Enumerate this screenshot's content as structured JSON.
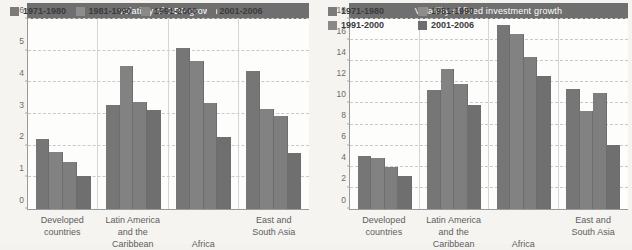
{
  "page": {
    "background_color": "#f6f4f1",
    "bar_color": "#7a7a7a",
    "title_bar_color": "#6f6f6f",
    "gridline_color": "#c9c9c9"
  },
  "charts": [
    {
      "id": "gdp-growth",
      "title": "Volatility of GDP growth",
      "type": "bar",
      "legend_rows": 1,
      "legend": [
        "1971-1980",
        "1981-1990",
        "1991-2000",
        "2001-2006"
      ],
      "categories": [
        {
          "line1": "Developed",
          "line2": "countries"
        },
        {
          "line1": "Latin America",
          "line2": "and the Caribbean"
        },
        {
          "line1": "Africa",
          "line2": ""
        },
        {
          "line1": "East and",
          "line2": "South Asia"
        }
      ],
      "yticks": [
        0,
        1,
        2,
        3,
        4,
        5,
        6
      ],
      "ylim": [
        0,
        6
      ],
      "ylabel": "",
      "xlabel": "",
      "series": [
        {
          "name": "1971-1980",
          "values": [
            2.2,
            3.28,
            5.1,
            4.35
          ]
        },
        {
          "name": "1981-1990",
          "values": [
            1.8,
            4.53,
            4.67,
            3.16
          ]
        },
        {
          "name": "1991-2000",
          "values": [
            1.5,
            3.38,
            3.35,
            2.95
          ]
        },
        {
          "name": "2001-2006",
          "values": [
            1.05,
            3.13,
            2.27,
            1.78
          ]
        }
      ]
    },
    {
      "id": "fixed-investment-growth",
      "title": "Volatility of fixed investment growth",
      "type": "bar",
      "legend_rows": 2,
      "legend": [
        "1971-1980",
        "1981-1990",
        "1991-2000",
        "2001-2006"
      ],
      "categories": [
        {
          "line1": "Developed",
          "line2": "countries"
        },
        {
          "line1": "Latin America",
          "line2": "and the Caribbean"
        },
        {
          "line1": "Africa",
          "line2": ""
        },
        {
          "line1": "East and",
          "line2": "South Asia"
        }
      ],
      "yticks": [
        0,
        2,
        4,
        6,
        8,
        10,
        12,
        14,
        16,
        18
      ],
      "ylim": [
        0,
        18
      ],
      "ylabel": "",
      "xlabel": "",
      "series": [
        {
          "name": "1971-1980",
          "values": [
            5.0,
            11.25,
            17.4,
            11.35
          ]
        },
        {
          "name": "1981-1990",
          "values": [
            4.85,
            13.3,
            16.6,
            9.3
          ]
        },
        {
          "name": "1991-2000",
          "values": [
            4.0,
            11.8,
            14.4,
            10.95
          ]
        },
        {
          "name": "2001-2006",
          "values": [
            3.15,
            9.85,
            12.6,
            6.1
          ]
        }
      ]
    }
  ],
  "chart_data": [
    {
      "type": "bar",
      "title": "Volatility of GDP growth",
      "categories": [
        "Developed countries",
        "Latin America and the Caribbean",
        "Africa",
        "East and South Asia"
      ],
      "series": [
        {
          "name": "1971-1980",
          "values": [
            2.2,
            3.28,
            5.1,
            4.35
          ]
        },
        {
          "name": "1981-1990",
          "values": [
            1.8,
            4.53,
            4.67,
            3.16
          ]
        },
        {
          "name": "1991-2000",
          "values": [
            1.5,
            3.38,
            3.35,
            2.95
          ]
        },
        {
          "name": "2001-2006",
          "values": [
            1.05,
            3.13,
            2.27,
            1.78
          ]
        }
      ],
      "xlabel": "",
      "ylabel": "",
      "ylim": [
        0,
        6
      ],
      "yticks": [
        0,
        1,
        2,
        3,
        4,
        5,
        6
      ],
      "grid": true,
      "legend_position": "top-inside"
    },
    {
      "type": "bar",
      "title": "Volatility of fixed investment growth",
      "categories": [
        "Developed countries",
        "Latin America and the Caribbean",
        "Africa",
        "East and South Asia"
      ],
      "series": [
        {
          "name": "1971-1980",
          "values": [
            5.0,
            11.25,
            17.4,
            11.35
          ]
        },
        {
          "name": "1981-1990",
          "values": [
            4.85,
            13.3,
            16.6,
            9.3
          ]
        },
        {
          "name": "1991-2000",
          "values": [
            4.0,
            11.8,
            14.4,
            10.95
          ]
        },
        {
          "name": "2001-2006",
          "values": [
            3.15,
            9.85,
            12.6,
            6.1
          ]
        }
      ],
      "xlabel": "",
      "ylabel": "",
      "ylim": [
        0,
        18
      ],
      "yticks": [
        0,
        2,
        4,
        6,
        8,
        10,
        12,
        14,
        16,
        18
      ],
      "grid": true,
      "legend_position": "top-inside"
    }
  ]
}
